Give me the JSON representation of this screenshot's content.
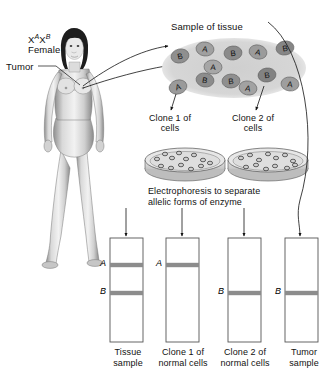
{
  "figure": {
    "type": "biology-diagram",
    "topic": "X-chromosome inactivation clonality analysis of tumor",
    "title_label": "Female",
    "genotype_x1": "X",
    "genotype_sup1": "A",
    "genotype_x2": "X",
    "genotype_sup2": "B",
    "tumor_label": "Tumor",
    "sample_label": "Sample of tissue",
    "clone1_label": "Clone 1 of\ncells",
    "clone2_label": "Clone 2 of\ncells",
    "electrophoresis_label": "Electrophoresis to separate\nallelic forms of enzyme"
  },
  "tissue_cells": [
    {
      "letter": "B",
      "x": 180,
      "y": 56,
      "rx": 9,
      "ry": 7,
      "rot": -12,
      "shade": "#8f8f8f"
    },
    {
      "letter": "A",
      "x": 205,
      "y": 49,
      "rx": 9,
      "ry": 7,
      "rot": 8,
      "shade": "#a0a0a0"
    },
    {
      "letter": "B",
      "x": 233,
      "y": 53,
      "rx": 9,
      "ry": 7,
      "rot": -6,
      "shade": "#8a8a8a"
    },
    {
      "letter": "A",
      "x": 258,
      "y": 52,
      "rx": 9,
      "ry": 7,
      "rot": 14,
      "shade": "#9b9b9b"
    },
    {
      "letter": "B",
      "x": 285,
      "y": 48,
      "rx": 9,
      "ry": 7,
      "rot": -10,
      "shade": "#868686"
    },
    {
      "letter": "A",
      "x": 213,
      "y": 67,
      "rx": 9,
      "ry": 7,
      "rot": 4,
      "shade": "#a6a6a6"
    },
    {
      "letter": "A",
      "x": 178,
      "y": 87,
      "rx": 9,
      "ry": 7,
      "rot": -16,
      "shade": "#9a9a9a"
    },
    {
      "letter": "B",
      "x": 205,
      "y": 80,
      "rx": 9,
      "ry": 7,
      "rot": 10,
      "shade": "#8c8c8c"
    },
    {
      "letter": "B",
      "x": 231,
      "y": 81,
      "rx": 9,
      "ry": 7,
      "rot": -4,
      "shade": "#8f8f8f"
    },
    {
      "letter": "A",
      "x": 248,
      "y": 88,
      "rx": 9,
      "ry": 7,
      "rot": 12,
      "shade": "#a2a2a2"
    },
    {
      "letter": "B",
      "x": 267,
      "y": 75,
      "rx": 9,
      "ry": 7,
      "rot": -8,
      "shade": "#828282"
    },
    {
      "letter": "A",
      "x": 290,
      "y": 84,
      "rx": 9,
      "ry": 7,
      "rot": 6,
      "shade": "#9e9e9e"
    }
  ],
  "petri_dishes": [
    {
      "name": "clone-1-dish",
      "cx": 185,
      "cy": 162,
      "colonies": [
        [
          -28,
          -2
        ],
        [
          -20,
          -7
        ],
        [
          -13,
          -3
        ],
        [
          -6,
          -8
        ],
        [
          1,
          -2
        ],
        [
          9,
          -6
        ],
        [
          18,
          -1
        ],
        [
          -24,
          5
        ],
        [
          -14,
          7
        ],
        [
          -4,
          4
        ],
        [
          6,
          8
        ],
        [
          16,
          5
        ],
        [
          25,
          2
        ]
      ]
    },
    {
      "name": "clone-2-dish",
      "cx": 268,
      "cy": 162,
      "colonies": [
        [
          -27,
          -3
        ],
        [
          -18,
          -6
        ],
        [
          -9,
          -1
        ],
        [
          0,
          -7
        ],
        [
          8,
          -3
        ],
        [
          17,
          -6
        ],
        [
          25,
          0
        ],
        [
          -22,
          6
        ],
        [
          -12,
          4
        ],
        [
          -2,
          8
        ],
        [
          7,
          5
        ],
        [
          19,
          7
        ],
        [
          27,
          4
        ]
      ]
    }
  ],
  "gel_lanes": [
    {
      "name": "tissue-sample-lane",
      "x": 110,
      "caption": "Tissue\nsample",
      "bands": [
        {
          "letter": "A",
          "y": 265
        },
        {
          "letter": "B",
          "y": 293
        }
      ]
    },
    {
      "name": "clone-1-normal-lane",
      "x": 166,
      "caption": "Clone 1 of\nnormal cells",
      "bands": [
        {
          "letter": "A",
          "y": 265
        }
      ]
    },
    {
      "name": "clone-2-normal-lane",
      "x": 228,
      "caption": "Clone 2 of\nnormal cells",
      "bands": [
        {
          "letter": "B",
          "y": 293
        }
      ]
    },
    {
      "name": "tumor-sample-lane",
      "x": 285,
      "caption": "Tumor\nsample",
      "bands": [
        {
          "letter": "B",
          "y": 293
        }
      ]
    }
  ],
  "colors": {
    "ink": "#111111",
    "band": "#8c8c8c",
    "lane_outline": "#555555",
    "tissue_blob": "#c9c9c9",
    "dish": "#d8d8d8"
  }
}
